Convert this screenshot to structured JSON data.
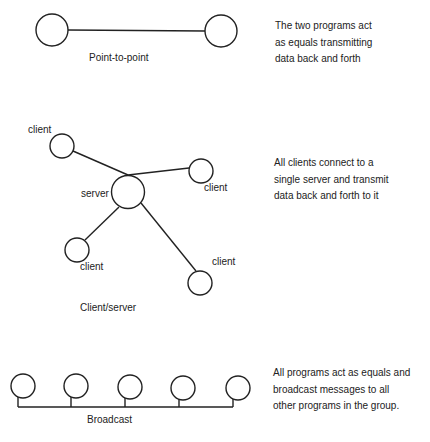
{
  "sections": {
    "point_to_point": {
      "caption": "Point-to-point",
      "description": "The two programs act\nas equals transmitting\ndata back and forth"
    },
    "client_server": {
      "caption": "Client/server",
      "description": "All clients connect to a\nsingle server and transmit\ndata back and forth to it",
      "server_label": "server",
      "client_labels": [
        "client",
        "client",
        "client",
        "client"
      ]
    },
    "broadcast": {
      "caption": "Broadcast",
      "description": "All programs act as equals and\nbroadcast messages to all\nother programs in the group."
    }
  },
  "colors": {
    "stroke": "#222222",
    "text": "#222222",
    "background": "#ffffff"
  }
}
